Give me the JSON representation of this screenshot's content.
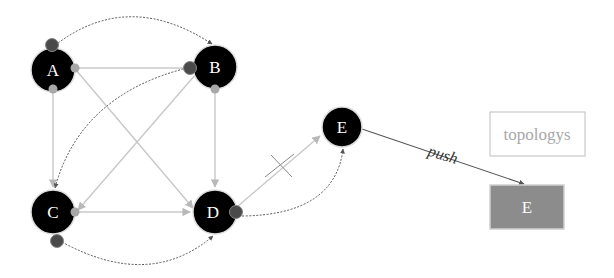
{
  "diagram": {
    "colors": {
      "node_fill": "#000000",
      "node_stroke": "#dcdcdc",
      "port_light": "#a8a8a8",
      "port_dark": "#4a4a4a",
      "edge_light": "#c8c8c8",
      "edge_dotted": "#555555",
      "push_edge": "#555555",
      "topology_box_stroke": "#c8c8c8",
      "topology_text": "#a8a8a8",
      "target_box_fill": "#8c8c8c",
      "target_box_stroke": "#cfcfcf"
    },
    "nodes": [
      {
        "id": "A",
        "label": "A",
        "cx": 53,
        "cy": 70,
        "r": 22
      },
      {
        "id": "B",
        "label": "B",
        "cx": 215,
        "cy": 67,
        "r": 22
      },
      {
        "id": "C",
        "label": "C",
        "cx": 53,
        "cy": 212,
        "r": 22
      },
      {
        "id": "D",
        "label": "D",
        "cx": 215,
        "cy": 212,
        "r": 22
      },
      {
        "id": "E",
        "label": "E",
        "cx": 342,
        "cy": 127,
        "r": 20
      }
    ],
    "edges_solid": [
      {
        "from": "A",
        "to": "B"
      },
      {
        "from": "A",
        "to": "C"
      },
      {
        "from": "A",
        "to": "D"
      },
      {
        "from": "B",
        "to": "C"
      },
      {
        "from": "B",
        "to": "D"
      },
      {
        "from": "C",
        "to": "D"
      },
      {
        "from": "D",
        "to": "E",
        "blocked": true
      }
    ],
    "edges_dotted": [
      {
        "from": "A",
        "to": "B"
      },
      {
        "from": "B",
        "to": "C"
      },
      {
        "from": "C",
        "to": "D"
      },
      {
        "from": "D",
        "to": "E"
      }
    ],
    "push_edge": {
      "from": "E",
      "to": "E-box",
      "label": "push"
    },
    "topology_box": {
      "label": "topologys"
    },
    "target_box": {
      "label": "E"
    }
  }
}
